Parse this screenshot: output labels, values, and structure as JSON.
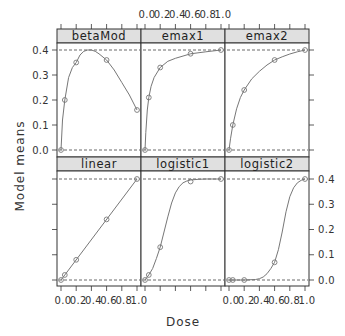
{
  "chart_data": {
    "type": "line",
    "layout": "trellis 3x2 (lattice xyplot)",
    "xlabel": "Dose",
    "ylabel": "Model means",
    "xlim": [
      0,
      1
    ],
    "ylim": [
      0,
      0.4
    ],
    "x_ticks": [
      0.0,
      0.2,
      0.4,
      0.6,
      0.8,
      1.0
    ],
    "x_tick_labels": [
      "0.0",
      "0.2",
      "0.4",
      "0.6",
      "0.8",
      "1.0"
    ],
    "y_ticks": [
      0.0,
      0.1,
      0.2,
      0.3,
      0.4
    ],
    "y_tick_labels": [
      "0.0",
      "0.1",
      "0.2",
      "0.3",
      "0.4"
    ],
    "reference_lines": [
      0.0,
      0.4
    ],
    "grid": false,
    "doses": [
      0,
      0.05,
      0.2,
      0.6,
      1
    ],
    "panels": [
      {
        "name": "betaMod",
        "row": 0,
        "col": 0,
        "points": {
          "x": [
            0,
            0.05,
            0.2,
            0.6,
            1
          ],
          "y": [
            0.0,
            0.2,
            0.35,
            0.36,
            0.16
          ]
        },
        "curve": {
          "x": [
            0,
            0.02,
            0.05,
            0.1,
            0.15,
            0.2,
            0.25,
            0.3,
            0.35,
            0.4,
            0.45,
            0.5,
            0.6,
            0.7,
            0.8,
            0.9,
            1.0
          ],
          "y": [
            0,
            0.12,
            0.2,
            0.29,
            0.33,
            0.35,
            0.38,
            0.395,
            0.4,
            0.4,
            0.395,
            0.385,
            0.36,
            0.32,
            0.27,
            0.22,
            0.16
          ]
        }
      },
      {
        "name": "emax1",
        "row": 0,
        "col": 1,
        "points": {
          "x": [
            0,
            0.05,
            0.2,
            0.6,
            1
          ],
          "y": [
            0.0,
            0.21,
            0.33,
            0.385,
            0.4
          ]
        },
        "curve": {
          "x": [
            0,
            0.01,
            0.03,
            0.05,
            0.08,
            0.12,
            0.2,
            0.3,
            0.4,
            0.6,
            0.8,
            1.0
          ],
          "y": [
            0,
            0.07,
            0.16,
            0.21,
            0.255,
            0.29,
            0.33,
            0.355,
            0.367,
            0.385,
            0.393,
            0.4
          ]
        }
      },
      {
        "name": "emax2",
        "row": 0,
        "col": 2,
        "points": {
          "x": [
            0,
            0.05,
            0.2,
            0.6,
            1
          ],
          "y": [
            0.0,
            0.1,
            0.24,
            0.36,
            0.4
          ]
        },
        "curve": {
          "x": [
            0,
            0.02,
            0.05,
            0.1,
            0.15,
            0.2,
            0.3,
            0.4,
            0.5,
            0.6,
            0.7,
            0.8,
            0.9,
            1.0
          ],
          "y": [
            0,
            0.045,
            0.1,
            0.165,
            0.21,
            0.24,
            0.285,
            0.315,
            0.34,
            0.36,
            0.373,
            0.384,
            0.393,
            0.4
          ]
        }
      },
      {
        "name": "linear",
        "row": 1,
        "col": 0,
        "points": {
          "x": [
            0,
            0.05,
            0.2,
            0.6,
            1
          ],
          "y": [
            0.0,
            0.02,
            0.08,
            0.24,
            0.4
          ]
        },
        "curve": {
          "x": [
            0,
            1
          ],
          "y": [
            0,
            0.4
          ]
        }
      },
      {
        "name": "logistic1",
        "row": 1,
        "col": 1,
        "points": {
          "x": [
            0,
            0.05,
            0.2,
            0.6,
            1
          ],
          "y": [
            0.0,
            0.02,
            0.13,
            0.39,
            0.4
          ]
        },
        "curve": {
          "x": [
            0,
            0.05,
            0.1,
            0.15,
            0.2,
            0.25,
            0.3,
            0.35,
            0.4,
            0.45,
            0.5,
            0.55,
            0.6,
            0.7,
            0.8,
            1.0
          ],
          "y": [
            0,
            0.02,
            0.045,
            0.085,
            0.13,
            0.19,
            0.25,
            0.305,
            0.345,
            0.37,
            0.385,
            0.392,
            0.396,
            0.399,
            0.4,
            0.4
          ]
        }
      },
      {
        "name": "logistic2",
        "row": 1,
        "col": 2,
        "points": {
          "x": [
            0,
            0.05,
            0.2,
            0.6,
            1
          ],
          "y": [
            0.0,
            0.0,
            0.0,
            0.07,
            0.4
          ]
        },
        "curve": {
          "x": [
            0,
            0.2,
            0.35,
            0.4,
            0.45,
            0.5,
            0.55,
            0.6,
            0.65,
            0.7,
            0.75,
            0.8,
            0.85,
            0.9,
            0.95,
            1.0
          ],
          "y": [
            0,
            0,
            0.002,
            0.005,
            0.012,
            0.025,
            0.045,
            0.07,
            0.12,
            0.19,
            0.27,
            0.33,
            0.365,
            0.385,
            0.395,
            0.4
          ]
        }
      }
    ]
  },
  "style": {
    "strip_fill": "#e0e0e0",
    "panel_border": "#333333",
    "line_color": "#777777",
    "point_color": "#777777",
    "ref_line_color": "#444444"
  }
}
